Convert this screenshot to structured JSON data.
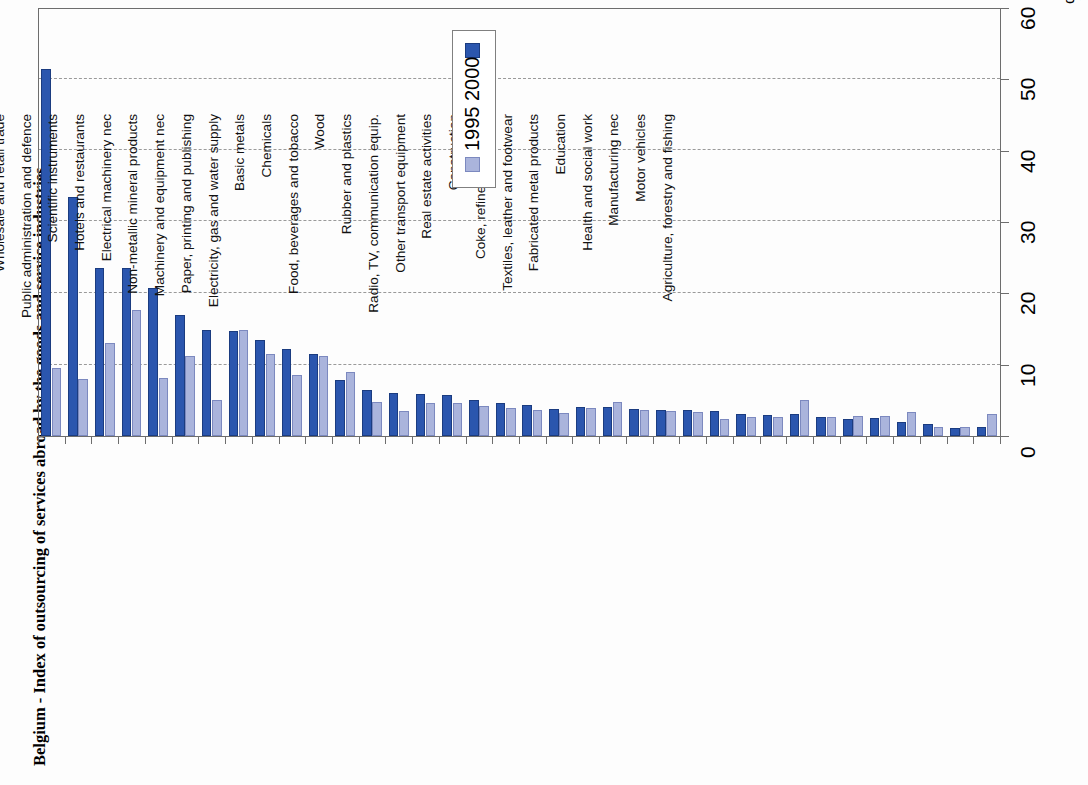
{
  "chart_data": {
    "type": "bar",
    "title": "Belgium - Index of outsourcing of services abroad by the goods and service industries",
    "xlabel": "",
    "ylabel": "%",
    "ylim": [
      0,
      60
    ],
    "yticks": [
      0,
      10,
      20,
      30,
      40,
      50,
      60
    ],
    "grid": true,
    "orientation": "vertical-rotated",
    "legend_position": "top-center-inside",
    "legend": [
      "1995",
      "2000"
    ],
    "colors": {
      "2000": "#2b56ae",
      "1995": "#aab4dc",
      "axis": "#6d6d6d",
      "grid": "#9a9a9a"
    },
    "categories": [
      "Office machinery and computers",
      "Research and development",
      "Computer and related activities",
      "Transport and storage",
      "Renting of machinery and equipment",
      "Other business activities",
      "Mining and quarrying",
      "Post and telecommunications",
      "Finance, insurance",
      "Community, social, personal services",
      "Wholesale and retail trade",
      "Public administration and defence",
      "Scientific instruments",
      "Hotels and restaurants",
      "Electrical machinery nec",
      "Non-metallic mineral products",
      "Machinery and equipment nec",
      "Paper, printing and publishing",
      "Electricity, gas and water supply",
      "Basic metals",
      "Chemicals",
      "Food, beverages and tobacco",
      "Wood",
      "Rubber and plastics",
      "Radio, TV, communication equip.",
      "Other transport equipment",
      "Real estate activities",
      "Construction",
      "Coke, refined petroleum",
      "Textiles, leather and footwear",
      "Fabricated metal products",
      "Education",
      "Health and social work",
      "Manufacturing nec",
      "Motor vehicles",
      "Agriculture, forestry and fishing"
    ],
    "series": [
      {
        "name": "2000",
        "values": [
          51.5,
          33.5,
          23.5,
          23.5,
          20.8,
          17.0,
          14.8,
          14.7,
          13.5,
          12.2,
          11.5,
          7.8,
          6.4,
          6.1,
          5.9,
          5.7,
          5.0,
          4.6,
          4.3,
          3.8,
          4.0,
          4.1,
          3.8,
          3.6,
          3.6,
          3.5,
          3.1,
          3.0,
          3.1,
          2.6,
          2.4,
          2.5,
          2.0,
          1.7,
          1.1,
          1.2
        ]
      },
      {
        "name": "1995",
        "values": [
          9.5,
          8.0,
          13.0,
          17.6,
          8.1,
          11.2,
          5.0,
          14.8,
          11.5,
          8.6,
          11.2,
          9.0,
          4.7,
          3.5,
          4.6,
          4.6,
          4.2,
          3.9,
          3.6,
          3.2,
          3.9,
          4.7,
          3.7,
          3.5,
          3.4,
          2.4,
          2.6,
          2.7,
          5.1,
          2.6,
          2.8,
          2.8,
          3.4,
          1.3,
          1.3,
          3.1
        ]
      }
    ]
  },
  "axis": {
    "percent_symbol": "%",
    "tick_labels": [
      "0",
      "10",
      "20",
      "30",
      "40",
      "50",
      "60"
    ]
  },
  "legend": {
    "entry_2000": "2000",
    "entry_1995": "1995"
  }
}
